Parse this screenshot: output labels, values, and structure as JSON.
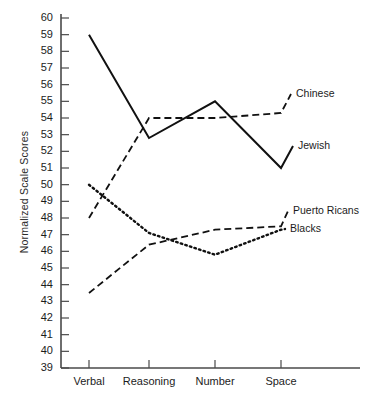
{
  "chart_data": {
    "type": "line",
    "title": "",
    "xlabel": "",
    "ylabel": "Normalized Scale Scores",
    "categories": [
      "Verbal",
      "Reasoning",
      "Number",
      "Space"
    ],
    "ylim": [
      39,
      60
    ],
    "ytick_labels": [
      "60",
      "59",
      "58",
      "57",
      "56",
      "55",
      "54",
      "53",
      "52",
      "51",
      "50",
      "49",
      "48",
      "47",
      "46",
      "45",
      "44",
      "43",
      "42",
      "41",
      "40",
      "39"
    ],
    "grid": false,
    "legend_position": "right-inline",
    "series": [
      {
        "name": "Chinese",
        "style": "dashed",
        "values": [
          48.0,
          54.0,
          54.0,
          54.3
        ]
      },
      {
        "name": "Jewish",
        "style": "solid",
        "values": [
          59.0,
          52.8,
          55.0,
          51.0
        ]
      },
      {
        "name": "Puerto Ricans",
        "style": "dashed",
        "values": [
          43.5,
          46.4,
          47.3,
          47.5
        ]
      },
      {
        "name": "Blacks",
        "style": "dotted",
        "values": [
          50.0,
          47.1,
          45.8,
          47.3
        ]
      }
    ]
  }
}
